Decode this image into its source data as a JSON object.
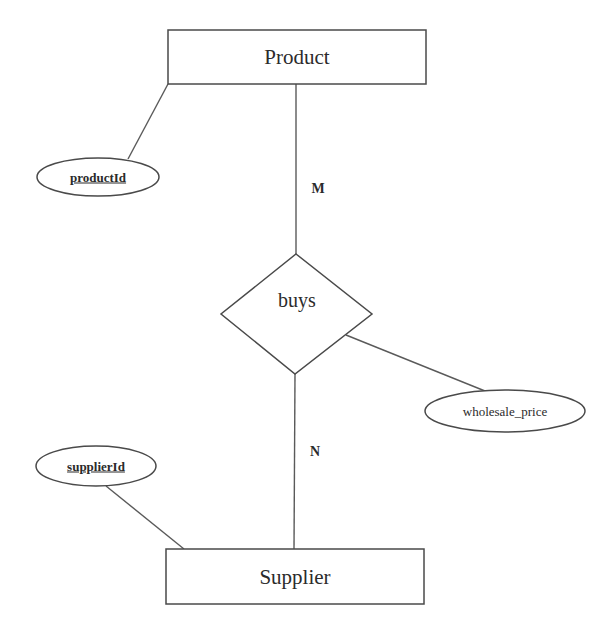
{
  "diagram": {
    "type": "er-diagram",
    "entities": [
      {
        "id": "product",
        "label": "Product",
        "x": 168,
        "y": 30,
        "w": 258,
        "h": 54
      },
      {
        "id": "supplier",
        "label": "Supplier",
        "x": 166,
        "y": 549,
        "w": 258,
        "h": 55
      }
    ],
    "relationships": [
      {
        "id": "buys",
        "label": "buys",
        "points": [
          [
            296,
            254
          ],
          [
            372,
            314
          ],
          [
            295,
            374
          ],
          [
            221,
            314
          ]
        ],
        "cx": 297,
        "cy": 300
      }
    ],
    "attributes": [
      {
        "id": "productId",
        "label": "productId",
        "is_key": true,
        "cx": 98,
        "cy": 177,
        "rx": 61,
        "ry": 19,
        "owner": "product"
      },
      {
        "id": "supplierId",
        "label": "supplierId",
        "is_key": true,
        "cx": 96,
        "cy": 466,
        "rx": 60,
        "ry": 20,
        "owner": "supplier"
      },
      {
        "id": "wholesale_price",
        "label": "wholesale_price",
        "is_key": false,
        "cx": 505,
        "cy": 411,
        "rx": 80,
        "ry": 21,
        "owner": "buys"
      }
    ],
    "connectors": [
      {
        "from": "product",
        "to": "buys",
        "x1": 296,
        "y1": 84,
        "x2": 296,
        "y2": 254,
        "cardinality": "M",
        "card_x": 318,
        "card_y": 189
      },
      {
        "from": "buys",
        "to": "supplier",
        "x1": 295,
        "y1": 374,
        "x2": 294,
        "y2": 549,
        "cardinality": "N",
        "card_x": 315,
        "card_y": 452
      },
      {
        "from": "productId",
        "to": "product",
        "x1": 128,
        "y1": 159,
        "x2": 168,
        "y2": 84
      },
      {
        "from": "supplierId",
        "to": "supplier",
        "x1": 106,
        "y1": 486,
        "x2": 184,
        "y2": 549
      },
      {
        "from": "buys",
        "to": "wholesale_price",
        "x1": 346,
        "y1": 335,
        "x2": 485,
        "y2": 391
      }
    ]
  }
}
